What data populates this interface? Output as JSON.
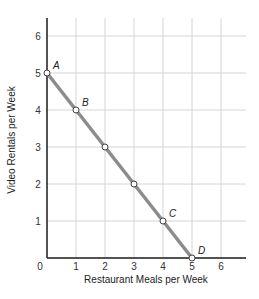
{
  "chart_data": {
    "type": "line",
    "title": "",
    "xlabel": "Restaurant Meals per Week",
    "ylabel": "Video Rentals per Week",
    "xlim": [
      0,
      6.9
    ],
    "ylim": [
      0,
      6.5
    ],
    "x_ticks": [
      0,
      1,
      2,
      3,
      4,
      5,
      6
    ],
    "y_ticks": [
      1,
      2,
      3,
      4,
      5,
      6
    ],
    "grid": true,
    "legend": null,
    "series": [
      {
        "name": "Budget line",
        "color": "#8c8c8c",
        "x": [
          0,
          1,
          2,
          3,
          4,
          5
        ],
        "y": [
          5,
          4,
          3,
          2,
          1,
          0
        ]
      }
    ],
    "annotations": [
      {
        "label": "A",
        "x": 0,
        "y": 5
      },
      {
        "label": "B",
        "x": 1,
        "y": 4
      },
      {
        "label": "C",
        "x": 4,
        "y": 1
      },
      {
        "label": "D",
        "x": 5,
        "y": 0
      }
    ]
  },
  "style": {
    "grid_color": "#d4d4d4",
    "axis_color": "#1a1a1a",
    "line_color": "#8c8c8c",
    "marker_fill": "#ffffff",
    "marker_stroke": "#444444"
  }
}
